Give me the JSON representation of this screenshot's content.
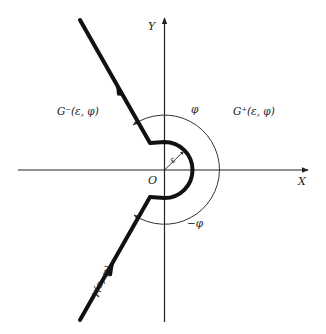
{
  "diagram": {
    "type": "complex-plane-contour",
    "axes": {
      "x_label": "X",
      "y_label": "Y",
      "origin_label": "O"
    },
    "regions": {
      "left_label": "G⁻(ε, φ)",
      "right_label": "G⁺(ε, φ)"
    },
    "contour": {
      "label": "γ(ε, φ)",
      "radius_label": "ε"
    },
    "angles": {
      "upper_label": "φ",
      "lower_label": "−φ"
    },
    "colors": {
      "contour": "#111111",
      "axes": "#222222",
      "arcs": "#333333",
      "background": "#ffffff"
    }
  }
}
